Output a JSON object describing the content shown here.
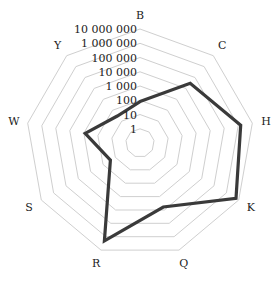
{
  "chart_data": {
    "type": "radar",
    "scale": "log",
    "categories": [
      "B",
      "C",
      "H",
      "K",
      "Q",
      "R",
      "S",
      "W",
      "Y"
    ],
    "series": [
      {
        "name": "series-1",
        "values": [
          80,
          30000,
          1500000,
          6000000,
          6000,
          2000000,
          25,
          800,
          30
        ],
        "color": "#3a3a3a"
      }
    ],
    "rings": [
      1,
      10,
      100,
      1000,
      10000,
      100000,
      1000000,
      10000000
    ],
    "ring_labels": [
      "1",
      "10",
      "100",
      "1 000",
      "10 000",
      "100 000",
      "1 000 000",
      "10 000 000"
    ],
    "title": "",
    "grid": true,
    "legend": "none"
  }
}
